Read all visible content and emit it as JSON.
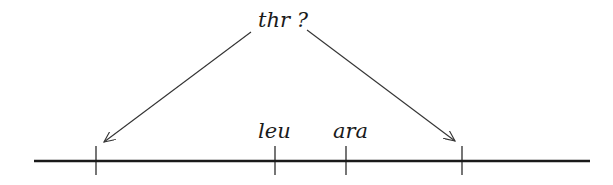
{
  "diagram": {
    "question_label": "thr ?",
    "markers": [
      {
        "id": "left-unknown",
        "label": "",
        "x": 96
      },
      {
        "id": "leu",
        "label": "leu",
        "x": 275
      },
      {
        "id": "ara",
        "label": "ara",
        "x": 346
      },
      {
        "id": "right-unknown",
        "label": "",
        "x": 462
      }
    ],
    "arrows": [
      {
        "from": [
          251,
          32
        ],
        "to": [
          104,
          142
        ]
      },
      {
        "from": [
          307,
          30
        ],
        "to": [
          455,
          141
        ]
      }
    ],
    "line": {
      "x1": 34,
      "x2": 590,
      "y": 161
    },
    "colors": {
      "line": "#1a1a1a",
      "arrow": "#333333",
      "text": "#1a1a1a"
    }
  }
}
